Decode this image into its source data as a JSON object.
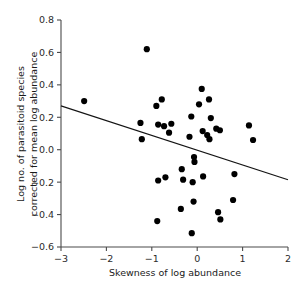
{
  "chart_data": {
    "type": "scatter",
    "title": "",
    "xlabel": "Skewness of log abundance",
    "ylabel": "Log no. of parasitoid species corrected for mean log abundance",
    "ylabel_line1": "Log no. of parasitoid species",
    "ylabel_line2": "corrected for mean log abundance",
    "xlim": [
      -3,
      2
    ],
    "ylim": [
      -0.6,
      0.8
    ],
    "xticks": [
      -3,
      -2,
      -1,
      0,
      1,
      2
    ],
    "xtick_labels": [
      "−3",
      "−2",
      "−1",
      "0",
      "1",
      "2"
    ],
    "yticks": [
      -0.6,
      -0.4,
      -0.2,
      0.0,
      0.2,
      0.4,
      0.6,
      0.8
    ],
    "ytick_labels": [
      "−0.6",
      "−0.4",
      "−0.2",
      "0.0",
      "0.2",
      "0.4",
      "0.6",
      "0.8"
    ],
    "grid": false,
    "legend": null,
    "point_color": "#000000",
    "line_color": "#141414",
    "marker_size": 3.1,
    "points": [
      {
        "x": -2.49,
        "y": 0.3
      },
      {
        "x": -1.11,
        "y": 0.62
      },
      {
        "x": -1.25,
        "y": 0.165
      },
      {
        "x": -1.22,
        "y": 0.065
      },
      {
        "x": -0.9,
        "y": 0.27
      },
      {
        "x": -0.78,
        "y": 0.31
      },
      {
        "x": -0.86,
        "y": 0.155
      },
      {
        "x": -0.73,
        "y": 0.145
      },
      {
        "x": -0.57,
        "y": 0.16
      },
      {
        "x": -0.62,
        "y": 0.105
      },
      {
        "x": -0.86,
        "y": -0.19
      },
      {
        "x": -0.7,
        "y": -0.17
      },
      {
        "x": -0.34,
        "y": -0.12
      },
      {
        "x": -0.31,
        "y": -0.185
      },
      {
        "x": -0.36,
        "y": -0.365
      },
      {
        "x": -0.88,
        "y": -0.44
      },
      {
        "x": -0.12,
        "y": -0.515
      },
      {
        "x": -0.13,
        "y": 0.205
      },
      {
        "x": -0.17,
        "y": 0.08
      },
      {
        "x": -0.07,
        "y": -0.045
      },
      {
        "x": -0.06,
        "y": -0.075
      },
      {
        "x": -0.1,
        "y": -0.2
      },
      {
        "x": -0.08,
        "y": -0.32
      },
      {
        "x": 0.1,
        "y": 0.375
      },
      {
        "x": 0.04,
        "y": 0.28
      },
      {
        "x": 0.26,
        "y": 0.31
      },
      {
        "x": 0.12,
        "y": 0.115
      },
      {
        "x": 0.22,
        "y": 0.09
      },
      {
        "x": 0.27,
        "y": 0.065
      },
      {
        "x": 0.3,
        "y": 0.195
      },
      {
        "x": 0.42,
        "y": 0.13
      },
      {
        "x": 0.5,
        "y": 0.12
      },
      {
        "x": 0.13,
        "y": -0.165
      },
      {
        "x": 0.46,
        "y": -0.385
      },
      {
        "x": 0.51,
        "y": -0.43
      },
      {
        "x": 0.79,
        "y": -0.31
      },
      {
        "x": 0.82,
        "y": -0.15
      },
      {
        "x": 1.14,
        "y": 0.15
      },
      {
        "x": 1.23,
        "y": 0.06
      }
    ],
    "fit_line": {
      "type": "linear-regression",
      "x_start": -3,
      "y_start": 0.27,
      "x_end": 2,
      "y_end": -0.185,
      "slope": -0.091,
      "intercept": -0.003
    }
  }
}
